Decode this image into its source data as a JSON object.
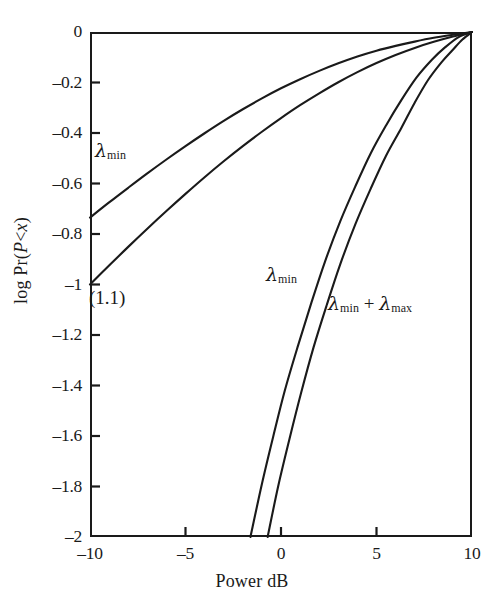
{
  "chart_data": {
    "type": "line",
    "title": "",
    "xlabel": "Power dB",
    "ylabel": "log Pr(P<x)",
    "xlim": [
      -10,
      10
    ],
    "ylim": [
      -2,
      0
    ],
    "grid": false,
    "legend": "none",
    "xticks": [
      "-10",
      "-5",
      "0",
      "5",
      "10"
    ],
    "xtick_values": [
      -10,
      -5,
      0,
      5,
      10
    ],
    "yticks": [
      "0",
      "-0.2",
      "-0.4",
      "-0.6",
      "-0.8",
      "-1",
      "-1.2",
      "-1.4",
      "-1.6",
      "-1.8",
      "-2"
    ],
    "ytick_values": [
      0,
      -0.2,
      -0.4,
      -0.6,
      -0.8,
      -1,
      -1.2,
      -1.4,
      -1.6,
      -1.8,
      -2
    ],
    "annotations": [
      {
        "id": "lmin-upper",
        "text": "λ",
        "sub": "min",
        "x": -8.7,
        "y": -0.44
      },
      {
        "id": "lmin-lower",
        "text": "λ",
        "sub": "min",
        "x": 0.9,
        "y": -0.93
      },
      {
        "id": "lmin-lmax",
        "text": "λ",
        "sub": "min",
        "text2": " + λ",
        "sub2": "max",
        "x": 2.4,
        "y": -1.05
      },
      {
        "id": "equation-ref",
        "text": "(1.1)",
        "x": -9.9,
        "y": -1.03
      }
    ],
    "series": [
      {
        "name": "λ_min (upper, gentle)",
        "label": "λmin",
        "x": [
          -10,
          -9,
          -8,
          -7,
          -6,
          -5,
          -4,
          -3,
          -2,
          -1,
          0,
          1,
          2,
          3,
          4,
          5,
          6,
          7,
          8,
          9,
          10
        ],
        "y": [
          -0.735,
          -0.675,
          -0.617,
          -0.56,
          -0.505,
          -0.452,
          -0.401,
          -0.352,
          -0.306,
          -0.263,
          -0.223,
          -0.187,
          -0.154,
          -0.124,
          -0.097,
          -0.074,
          -0.055,
          -0.038,
          -0.023,
          -0.011,
          0.0
        ]
      },
      {
        "name": "second gentle curve",
        "label": "",
        "x": [
          -10,
          -9,
          -8,
          -7,
          -6,
          -5,
          -4,
          -3,
          -2,
          -1,
          0,
          1,
          2,
          3,
          4,
          5,
          6,
          7,
          8,
          9,
          10
        ],
        "y": [
          -1.0,
          -0.925,
          -0.851,
          -0.779,
          -0.709,
          -0.641,
          -0.575,
          -0.512,
          -0.452,
          -0.395,
          -0.341,
          -0.29,
          -0.243,
          -0.199,
          -0.159,
          -0.123,
          -0.091,
          -0.063,
          -0.039,
          -0.018,
          0.0
        ]
      },
      {
        "name": "λ_min (steep)",
        "label": "λmin",
        "x": [
          -1.6,
          -1.0,
          -0.4,
          0.2,
          0.9,
          1.6,
          2.3,
          3.1,
          3.9,
          4.7,
          5.5,
          6.3,
          7.1,
          7.9,
          8.6,
          9.3,
          10
        ],
        "y": [
          -2.0,
          -1.79,
          -1.6,
          -1.42,
          -1.24,
          -1.07,
          -0.91,
          -0.75,
          -0.61,
          -0.48,
          -0.37,
          -0.27,
          -0.18,
          -0.11,
          -0.06,
          -0.02,
          0.0
        ]
      },
      {
        "name": "λ_min + λ_max (steep)",
        "label": "λmin + λmax",
        "x": [
          -0.7,
          -0.15,
          0.45,
          1.05,
          1.7,
          2.4,
          3.1,
          3.9,
          4.7,
          5.5,
          6.3,
          7.0,
          7.7,
          8.4,
          9.0,
          9.5,
          10
        ],
        "y": [
          -2.0,
          -1.8,
          -1.61,
          -1.43,
          -1.25,
          -1.08,
          -0.92,
          -0.76,
          -0.62,
          -0.49,
          -0.38,
          -0.28,
          -0.19,
          -0.12,
          -0.07,
          -0.03,
          0.0
        ]
      }
    ],
    "colors": {
      "line": "#1a1a1a",
      "axis": "#1a1a1a",
      "background": "#ffffff"
    }
  },
  "axes": {
    "x_title": "Power dB",
    "y_title_parts": {
      "pre": "log Pr(",
      "italic1": "P",
      "mid": "<",
      "italic2": "x",
      "post": ")"
    },
    "x_tick_labels": [
      "–10",
      "–5",
      "0",
      "5",
      "10"
    ],
    "y_tick_labels": [
      "0",
      "–0.2",
      "–0.4",
      "–0.6",
      "–0.8",
      "–1",
      "–1.2",
      "–1.4",
      "–1.6",
      "–1.8",
      "–2"
    ]
  },
  "labels": {
    "lambda": "λ",
    "sub_min": "min",
    "sub_max": "max",
    "plus": " + ",
    "equation_ref": "(1.1)"
  }
}
